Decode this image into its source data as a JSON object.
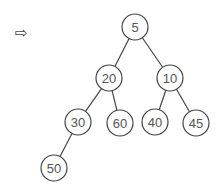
{
  "arrow": {
    "glyph": "⇨",
    "icon": "right-arrow-icon"
  },
  "tree": {
    "type": "binary-tree",
    "nodes": [
      {
        "id": "n5",
        "label": "5",
        "x": 135,
        "y": 27
      },
      {
        "id": "n20",
        "label": "20",
        "x": 109,
        "y": 78
      },
      {
        "id": "n10",
        "label": "10",
        "x": 170,
        "y": 78
      },
      {
        "id": "n30",
        "label": "30",
        "x": 78,
        "y": 122
      },
      {
        "id": "n60",
        "label": "60",
        "x": 120,
        "y": 123
      },
      {
        "id": "n40",
        "label": "40",
        "x": 155,
        "y": 122
      },
      {
        "id": "n45",
        "label": "45",
        "x": 196,
        "y": 123
      },
      {
        "id": "n50",
        "label": "50",
        "x": 54,
        "y": 168
      }
    ],
    "edges": [
      [
        "n5",
        "n20"
      ],
      [
        "n5",
        "n10"
      ],
      [
        "n20",
        "n30"
      ],
      [
        "n20",
        "n60"
      ],
      [
        "n10",
        "n40"
      ],
      [
        "n10",
        "n45"
      ],
      [
        "n30",
        "n50"
      ]
    ],
    "radius": 13,
    "stroke_color": "#444444",
    "fill_color": "#ffffff"
  }
}
